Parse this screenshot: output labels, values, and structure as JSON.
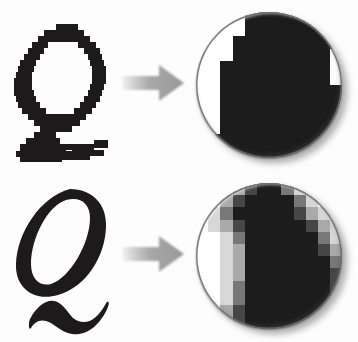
{
  "figure": {
    "background_color": "#fdfdfd",
    "width": 358,
    "height": 342
  },
  "palette": {
    "ink": "#1c1a1a",
    "paper": "#ffffff",
    "arrow_gray": "#9a9a9a",
    "arrow_gray_light": "#e4e4e4",
    "rim_gray": "#8e8e8e",
    "shadow_gray": "#555555"
  },
  "rows": [
    {
      "id": "aliased",
      "letter": {
        "glyph": "Q",
        "style": "italic-serif",
        "rendering": "aliased",
        "icon_name": "pixelated-letter-q"
      },
      "arrow": {
        "icon_name": "right-arrow-icon",
        "direction": "right",
        "color": "#9a9a9a"
      },
      "magnifier": {
        "icon_name": "magnified-pixels-circle",
        "rendering": "aliased",
        "gray_levels": 2,
        "cell_size": 12.2,
        "cells": [
          {
            "x": 0,
            "y": 0,
            "w": 12,
            "h": 12,
            "v": 255
          }
        ]
      }
    },
    {
      "id": "antialiased",
      "letter": {
        "glyph": "Q",
        "style": "italic-serif",
        "rendering": "anti-aliased",
        "icon_name": "smooth-letter-q"
      },
      "arrow": {
        "icon_name": "right-arrow-icon",
        "direction": "right",
        "color": "#9a9a9a"
      },
      "magnifier": {
        "icon_name": "magnified-pixels-circle",
        "rendering": "anti-aliased",
        "gray_levels": 6,
        "cell_size": 12.2,
        "cells": [
          {
            "x": 0,
            "y": 0,
            "w": 12,
            "h": 12,
            "v": 255
          }
        ]
      }
    }
  ],
  "pixel_maps": {
    "aliased": {
      "cols": 12,
      "rows": 12,
      "cell": 12.2,
      "note": "0 = white paper, 1 = solid black ink. Hard staircase edge, no intermediate tones.",
      "grid": [
        [
          0,
          0,
          0,
          0,
          1,
          1,
          1,
          1,
          1,
          1,
          1,
          1
        ],
        [
          0,
          0,
          0,
          0,
          1,
          1,
          1,
          1,
          1,
          1,
          1,
          1
        ],
        [
          0,
          0,
          0,
          1,
          1,
          1,
          1,
          1,
          1,
          1,
          1,
          1
        ],
        [
          0,
          0,
          0,
          1,
          1,
          1,
          1,
          1,
          1,
          1,
          1,
          0
        ],
        [
          0,
          0,
          1,
          1,
          1,
          1,
          1,
          1,
          1,
          1,
          1,
          0
        ],
        [
          0,
          0,
          1,
          1,
          1,
          1,
          1,
          1,
          1,
          1,
          1,
          0
        ],
        [
          0,
          0,
          1,
          1,
          1,
          1,
          1,
          1,
          1,
          1,
          1,
          1
        ],
        [
          0,
          0,
          1,
          1,
          1,
          1,
          1,
          1,
          1,
          1,
          1,
          1
        ],
        [
          0,
          0,
          1,
          1,
          1,
          1,
          1,
          1,
          1,
          1,
          1,
          1
        ],
        [
          0,
          0,
          1,
          1,
          1,
          1,
          1,
          1,
          1,
          1,
          1,
          1
        ],
        [
          0,
          1,
          1,
          1,
          1,
          1,
          1,
          1,
          1,
          1,
          1,
          1
        ],
        [
          0,
          1,
          1,
          1,
          1,
          1,
          1,
          1,
          1,
          1,
          1,
          1
        ]
      ]
    },
    "antialiased": {
      "cols": 12,
      "rows": 12,
      "cell": 12.2,
      "note": "0 = white, 5 = solid black. Intermediate values are partial-coverage gray pixels that soften the staircase.",
      "levels": [
        255,
        215,
        170,
        120,
        70,
        28
      ],
      "grid": [
        [
          0,
          0,
          0,
          2,
          4,
          5,
          5,
          3,
          1,
          0,
          0,
          0
        ],
        [
          0,
          0,
          2,
          4,
          5,
          5,
          5,
          5,
          3,
          1,
          0,
          0
        ],
        [
          0,
          1,
          3,
          5,
          5,
          5,
          5,
          5,
          4,
          2,
          1,
          0
        ],
        [
          0,
          1,
          2,
          4,
          5,
          5,
          5,
          5,
          5,
          4,
          2,
          1
        ],
        [
          0,
          0,
          1,
          3,
          5,
          5,
          5,
          5,
          5,
          5,
          3,
          1
        ],
        [
          0,
          0,
          1,
          2,
          5,
          5,
          5,
          5,
          5,
          5,
          4,
          2
        ],
        [
          0,
          0,
          1,
          2,
          5,
          5,
          5,
          5,
          5,
          5,
          5,
          3
        ],
        [
          0,
          0,
          1,
          2,
          5,
          5,
          5,
          5,
          5,
          5,
          5,
          4
        ],
        [
          0,
          0,
          1,
          3,
          5,
          5,
          5,
          5,
          5,
          5,
          5,
          4
        ],
        [
          0,
          0,
          1,
          3,
          5,
          5,
          5,
          5,
          5,
          5,
          5,
          5
        ],
        [
          0,
          0,
          2,
          4,
          5,
          5,
          5,
          5,
          5,
          5,
          5,
          5
        ],
        [
          0,
          0,
          2,
          4,
          5,
          5,
          5,
          5,
          5,
          5,
          5,
          5
        ]
      ]
    }
  }
}
